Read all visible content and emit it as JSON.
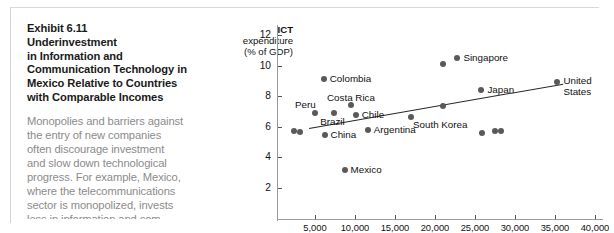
{
  "caption": {
    "exhibit_number": "Exhibit 6.11",
    "title_lines": [
      "Underinvestment",
      "in Information and",
      "Communication Technology in",
      "Mexico Relative to Countries",
      "with Comparable Incomes"
    ],
    "body_lines": [
      "Monopolies and barriers against",
      "the entry of new companies",
      "often discourage investment",
      "and slow down technological",
      "progress. For example, Mexico,",
      "where the telecommunications",
      "sector is monopolized, invests",
      "less in information and com-"
    ]
  },
  "chart_data": {
    "type": "scatter",
    "title": "",
    "ylabel_lines": [
      "ICT",
      "expenditure",
      "(% of GDP)"
    ],
    "xlabel": "",
    "xlim": [
      0,
      40000
    ],
    "ylim": [
      0,
      12
    ],
    "yticks": [
      2,
      4,
      6,
      8,
      10,
      12
    ],
    "xticks": [
      5000,
      10000,
      15000,
      20000,
      25000,
      30000,
      35000,
      40000
    ],
    "xtick_labels": [
      "5,000",
      "10,000",
      "15,000",
      "20,000",
      "25,000",
      "30,000",
      "35,000",
      "40,000"
    ],
    "grid": false,
    "legend": "none",
    "marker_color": "#595959",
    "trendline": {
      "x0": 4200,
      "y0": 5.95,
      "x1": 36000,
      "y1": 8.85,
      "color": "#262626"
    },
    "points": [
      {
        "label": "",
        "x": 2400,
        "y": 5.75,
        "label_pos": "none"
      },
      {
        "label": "",
        "x": 3150,
        "y": 5.65,
        "label_pos": "none"
      },
      {
        "label": "Peru",
        "x": 5000,
        "y": 6.9,
        "label_pos": "above-left"
      },
      {
        "label": "Brazil",
        "x": 7400,
        "y": 6.9,
        "label_pos": "below"
      },
      {
        "label": "China",
        "x": 6200,
        "y": 5.45,
        "label_pos": "right"
      },
      {
        "label": "Colombia",
        "x": 6100,
        "y": 9.1,
        "label_pos": "right"
      },
      {
        "label": "Costa Rica",
        "x": 9500,
        "y": 7.45,
        "label_pos": "above-right"
      },
      {
        "label": "Chile",
        "x": 10100,
        "y": 6.75,
        "label_pos": "right"
      },
      {
        "label": "Mexico",
        "x": 8700,
        "y": 3.2,
        "label_pos": "right"
      },
      {
        "label": "Argentina",
        "x": 11600,
        "y": 5.8,
        "label_pos": "right"
      },
      {
        "label": "South Korea",
        "x": 17000,
        "y": 6.65,
        "label_pos": "below-right"
      },
      {
        "label": "",
        "x": 21000,
        "y": 7.35,
        "label_pos": "none"
      },
      {
        "label": "",
        "x": 21000,
        "y": 10.1,
        "label_pos": "none"
      },
      {
        "label": "Singapore",
        "x": 22800,
        "y": 10.5,
        "label_pos": "right"
      },
      {
        "label": "Japan",
        "x": 25800,
        "y": 8.4,
        "label_pos": "right"
      },
      {
        "label": "",
        "x": 25900,
        "y": 5.6,
        "label_pos": "none"
      },
      {
        "label": "",
        "x": 27500,
        "y": 5.7,
        "label_pos": "none"
      },
      {
        "label": "",
        "x": 28300,
        "y": 5.7,
        "label_pos": "none"
      },
      {
        "label": "United States",
        "x": 35300,
        "y": 8.9,
        "label_pos": "right"
      }
    ],
    "point_labels": [
      "Peru",
      "Brazil",
      "China",
      "Colombia",
      "Costa Rica",
      "Chile",
      "Mexico",
      "Argentina",
      "South Korea",
      "Singapore",
      "Japan",
      "United States"
    ]
  }
}
